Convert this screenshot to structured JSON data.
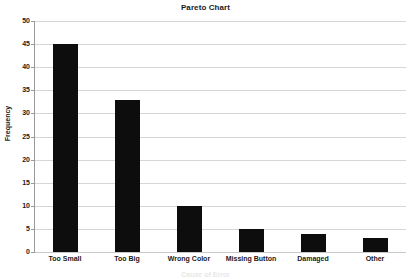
{
  "chart_data": {
    "type": "bar",
    "title": "Pareto Chart",
    "xlabel": "Cause of Error",
    "ylabel": "Frequency",
    "categories": [
      "Too Small",
      "Too Big",
      "Wrong Color",
      "Missing Button",
      "Damaged",
      "Other"
    ],
    "values": [
      45,
      33,
      10,
      5,
      4,
      3
    ],
    "ylim": [
      0,
      50
    ],
    "yticks": [
      0,
      5,
      10,
      15,
      20,
      25,
      30,
      35,
      40,
      45,
      50
    ],
    "ytick_labels": [
      "0",
      "5",
      "10",
      "15",
      "20",
      "25",
      "30",
      "35",
      "40",
      "45",
      "50"
    ],
    "grid": true,
    "legend": false,
    "bar_color": "#0d0d0d",
    "gridline_color": "#d6d6d6",
    "axis_color": "#9a9a9a",
    "background_color": "#ffffff",
    "text_color": "#1a1a1a"
  }
}
